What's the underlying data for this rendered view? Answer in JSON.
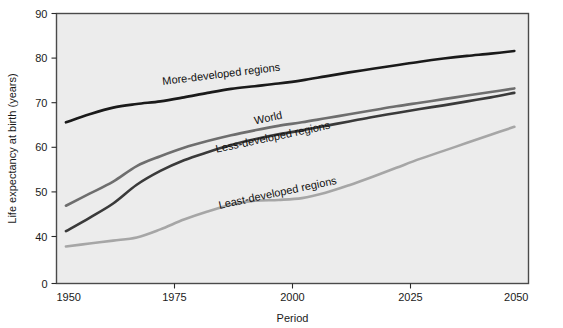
{
  "chart_data": {
    "type": "line",
    "title": "",
    "xlabel": "Period",
    "ylabel": "Life expectancy at birth (years)",
    "xlim": [
      1950,
      2050
    ],
    "ylim": [
      0,
      90
    ],
    "y_axis_break": true,
    "y_break_between": [
      0,
      40
    ],
    "grid": false,
    "legend_position": "inline-labels",
    "xticks": [
      1950,
      1975,
      2000,
      2025,
      2050
    ],
    "xtick_labels": [
      "1950",
      "1975",
      "2000",
      "2025",
      "2050"
    ],
    "yticks": [
      0,
      40,
      50,
      60,
      70,
      80,
      90
    ],
    "ytick_labels": [
      "0",
      "40",
      "50",
      "60",
      "70",
      "80",
      "90"
    ],
    "x": [
      1952,
      1957,
      1962,
      1967,
      1972,
      1977,
      1982,
      1987,
      1992,
      1997,
      2002,
      2007,
      2012,
      2017,
      2022,
      2027,
      2032,
      2037,
      2042,
      2047
    ],
    "series": [
      {
        "name": "More-developed regions",
        "color": "#1a1a1a",
        "width": 2.6,
        "label_x": 1985,
        "label_y": 75.6,
        "label_rotation": -7,
        "values": [
          65.6,
          67.4,
          68.9,
          69.7,
          70.3,
          71.2,
          72.2,
          73.1,
          73.7,
          74.3,
          75.0,
          75.9,
          76.8,
          77.6,
          78.4,
          79.2,
          79.9,
          80.5,
          81.0,
          81.6
        ]
      },
      {
        "name": "World",
        "color": "#6e6e6e",
        "width": 2.6,
        "label_x": 1995,
        "label_y": 65.8,
        "label_rotation": -12,
        "values": [
          46.9,
          49.6,
          52.3,
          55.8,
          58.0,
          59.9,
          61.4,
          62.7,
          63.8,
          64.8,
          65.6,
          66.5,
          67.4,
          68.3,
          69.2,
          70.0,
          70.8,
          71.6,
          72.4,
          73.2
        ]
      },
      {
        "name": "Less-developed regions",
        "color": "#3a3a3a",
        "width": 2.6,
        "label_x": 1996,
        "label_y": 61.5,
        "label_rotation": -12,
        "values": [
          41.2,
          44.2,
          47.4,
          51.6,
          54.7,
          57.1,
          58.9,
          60.5,
          61.8,
          62.9,
          63.8,
          64.8,
          65.8,
          66.8,
          67.7,
          68.6,
          69.4,
          70.3,
          71.2,
          72.2
        ]
      },
      {
        "name": "Least-developed regions",
        "color": "#a6a6a6",
        "width": 2.6,
        "label_x": 1997,
        "label_y": 49.0,
        "label_rotation": -12,
        "values": [
          31.5,
          34.0,
          36.5,
          39.2,
          41.6,
          43.8,
          45.6,
          47.1,
          48.0,
          48.2,
          48.6,
          49.8,
          51.5,
          53.4,
          55.4,
          57.4,
          59.2,
          61.0,
          62.8,
          64.6
        ]
      }
    ]
  }
}
